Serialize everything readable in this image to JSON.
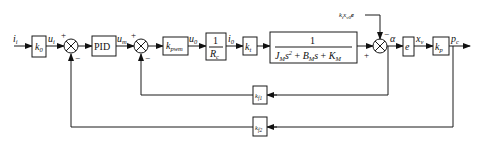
{
  "diagram": {
    "type": "control-block-diagram",
    "signals": {
      "input": "i",
      "input_sub": "i",
      "u_i": "u",
      "u_i_sub": "i",
      "u_m": "u",
      "u_m_sub": "m",
      "u_0": "u",
      "u_0_sub": "0",
      "i_0": "i",
      "i_0_sub": "0",
      "alpha": "α",
      "x_v": "x",
      "x_v_sub": "v",
      "p_c": "p",
      "p_c_sub": "c",
      "disturbance": "k",
      "disturbance_rest": "x",
      "disturbance_e": "e",
      "disturbance_sub1": "t",
      "disturbance_sub2": "v0"
    },
    "blocks": {
      "k0": {
        "main": "k",
        "sub": "0"
      },
      "pid": {
        "label": "PID"
      },
      "kpwm": {
        "main": "k",
        "sub": "pwm"
      },
      "inv_rc": {
        "num": "1",
        "den_main": "R",
        "den_sub": "c"
      },
      "kt": {
        "main": "k",
        "sub": "t"
      },
      "plant": {
        "num": "1",
        "den": "J_M s² + B_M s + K_M",
        "den_J": "J",
        "den_J_sub": "M",
        "den_s2": "s",
        "den_sup": "2",
        "den_plus1": " + ",
        "den_B": "B",
        "den_B_sub": "M",
        "den_s": "s",
        "den_plus2": " + ",
        "den_K": "K",
        "den_K_sub": "M"
      },
      "e": {
        "main": "e"
      },
      "kp": {
        "main": "k",
        "sub": "p"
      },
      "kf1": {
        "main": "k",
        "sub": "f1"
      },
      "kf2": {
        "main": "k",
        "sub": "f2"
      }
    },
    "summing_junctions": [
      {
        "id": "sum1",
        "top_sign": "+",
        "bottom_sign": "−"
      },
      {
        "id": "sum2",
        "top_sign": "+",
        "bottom_sign": "−"
      },
      {
        "id": "sum3",
        "left_sign": "+",
        "top_sign": "−"
      }
    ]
  }
}
